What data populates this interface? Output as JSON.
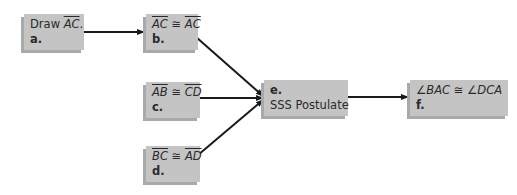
{
  "diagram": {
    "type": "flow-proof",
    "nodes": [
      {
        "id": "a",
        "label": "a.",
        "statement_prefix": "Draw ",
        "seg1": "AC",
        "statement_suffix": "."
      },
      {
        "id": "b",
        "label": "b.",
        "seg1": "AC",
        "rel": " ≅ ",
        "seg2": "AC"
      },
      {
        "id": "c",
        "label": "c.",
        "seg1": "AB",
        "rel": " ≅ ",
        "seg2": "CD"
      },
      {
        "id": "d",
        "label": "d.",
        "seg1": "BC",
        "rel": " ≅ ",
        "seg2": "AD"
      },
      {
        "id": "e",
        "label": "e.",
        "statement": "SSS Postulate"
      },
      {
        "id": "f",
        "label": "f.",
        "statement": "∠BAC ≅ ∠DCA"
      }
    ],
    "edges": [
      {
        "from": "a",
        "to": "b"
      },
      {
        "from": "b",
        "to": "e"
      },
      {
        "from": "c",
        "to": "e"
      },
      {
        "from": "d",
        "to": "e"
      },
      {
        "from": "e",
        "to": "f"
      }
    ],
    "colors": {
      "box_fill": "#c4c4c4",
      "box_shadow": "#a9a9a9",
      "arrow": "#1a1a1a",
      "text": "#2a2a2a"
    }
  }
}
